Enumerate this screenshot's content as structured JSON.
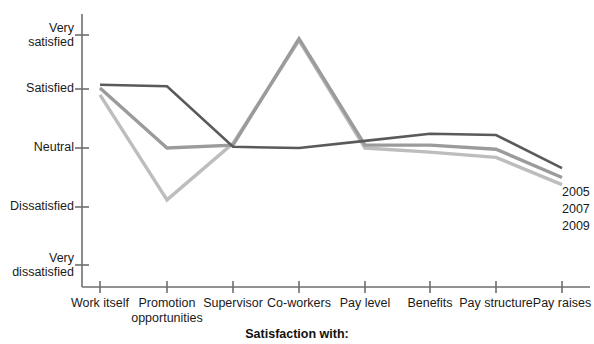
{
  "chart_data": {
    "type": "line",
    "title": "",
    "xlabel": "Satisfaction with:",
    "ylabel": "",
    "categories": [
      "Work itself",
      "Promotion opportunities",
      "Supervisor",
      "Co-workers",
      "Pay level",
      "Benefits",
      "Pay structure",
      "Pay raises"
    ],
    "ytick_labels": [
      "Very satisfied",
      "Satisfied",
      "Neutral",
      "Dissatisfied",
      "Very dissatisfied"
    ],
    "ylim": [
      1,
      5
    ],
    "ytick_values": [
      5,
      4,
      3,
      2,
      1
    ],
    "grid": false,
    "legend_position": "right-end-of-line",
    "series": [
      {
        "name": "2005",
        "color": "#5a5a5a",
        "values": [
          4.08,
          4.05,
          3.02,
          3.0,
          3.12,
          3.24,
          3.22,
          2.66
        ]
      },
      {
        "name": "2007",
        "color": "#9b9b9b",
        "values": [
          4.02,
          3.0,
          3.05,
          4.93,
          3.05,
          3.05,
          2.98,
          2.5
        ]
      },
      {
        "name": "2009",
        "color": "#bdbdbd",
        "values": [
          3.9,
          2.12,
          3.08,
          4.9,
          3.0,
          2.93,
          2.84,
          2.38
        ]
      }
    ]
  },
  "axis": {
    "x_title": "Satisfaction with:"
  },
  "legend": {
    "entries": [
      "2005",
      "2007",
      "2009"
    ]
  }
}
